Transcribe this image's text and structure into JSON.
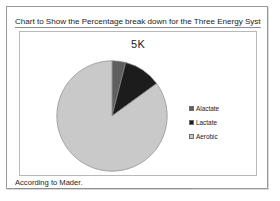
{
  "slide": {
    "title": "Chart to Show the Percentage break down for the Three Energy Systems",
    "footer_note": "According to Mader."
  },
  "colors": {
    "alactate": "#5f5f5f",
    "lactate": "#1c1c1c",
    "aerobic": "#c9c9c9",
    "pie_outline": "#8a8a8a",
    "frame_border": "#9a9a9a",
    "chart_border": "#b9b9b9",
    "text": "#1d1d1d"
  },
  "chart_data": {
    "type": "pie",
    "title": "5K",
    "xlabel": "",
    "ylabel": "",
    "categories": [
      "Alactate",
      "Lactate",
      "Aerobic"
    ],
    "values": [
      4,
      11,
      85
    ],
    "slices": [
      {
        "label": "Alactate",
        "value": 4,
        "color": "#5f5f5f"
      },
      {
        "label": "Lactate",
        "value": 11,
        "color": "#1c1c1c"
      },
      {
        "label": "Aerobic",
        "value": 85,
        "color": "#c9c9c9"
      }
    ],
    "legend": {
      "position": "right",
      "entries": [
        {
          "label": "Alactate",
          "color": "#5f5f5f"
        },
        {
          "label": "Lactate",
          "color": "#1c1c1c"
        },
        {
          "label": "Aerobic",
          "color": "#c9c9c9"
        }
      ]
    },
    "grid": false,
    "start_angle": 0,
    "direction": "clockwise"
  }
}
